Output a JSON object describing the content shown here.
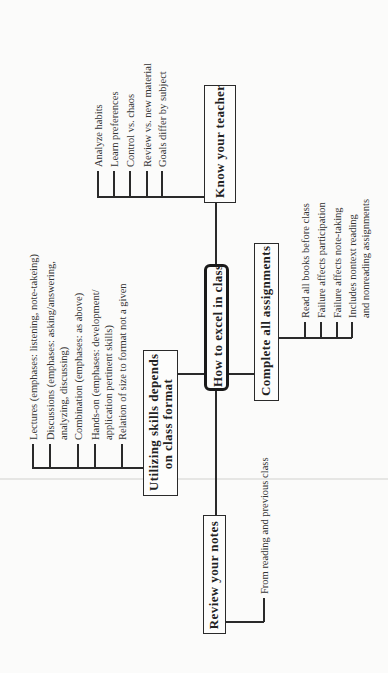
{
  "diagram": {
    "type": "mind-map",
    "orientation": "rotated-90-ccw",
    "center": {
      "label": "How to excel in class"
    },
    "branches": [
      {
        "id": "know-teacher",
        "label": "Know your teacher",
        "children": [
          "Analyze habits",
          "Learn preferences",
          "Control vs. chaos",
          "Review vs. new material",
          "Goals differ by subject"
        ]
      },
      {
        "id": "complete-assignments",
        "label": "Complete all assignments",
        "children": [
          "Read all books before class",
          "Failure affects participation",
          "Failure affects note-taking",
          "Includes nontext reading\nand nonreading assignments"
        ],
        "children_lines": [
          [
            "Read all books before class"
          ],
          [
            "Failure affects participation"
          ],
          [
            "Failure affects note-taking"
          ],
          [
            "Includes nontext reading",
            "and nonreading assignments"
          ]
        ]
      },
      {
        "id": "utilizing-skills",
        "label": "Utilizing skills depends on class format",
        "label_lines": [
          "Utilizing skills depends",
          "on class format"
        ],
        "children": [
          "Lectures (emphases: listening, note-takeing)",
          "Discussions (emphases: asking/answering, analyzing, discussing)",
          "Combination (emphases: as above)",
          "Hands-on (emphases: development/ application pertinent skills)",
          "Relation of size to format not a given"
        ],
        "children_lines": [
          [
            "Lectures (emphases: listening, note-takeing)"
          ],
          [
            "Discussions (emphases: asking/answering,",
            "analyzing, discussing)"
          ],
          [
            "Combination (emphases: as above)"
          ],
          [
            "Hands-on (emphases: development/",
            "application pertinent skills)"
          ],
          [
            "Relation of size to format not a given"
          ]
        ]
      },
      {
        "id": "review-notes",
        "label": "Review your notes",
        "children": [
          "From reading and previous class"
        ]
      }
    ]
  }
}
